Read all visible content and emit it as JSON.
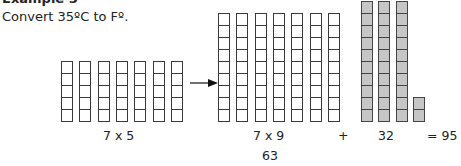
{
  "header": {
    "title": "Example 5",
    "prompt": "Convert 35ºC to Fº."
  },
  "diagram": {
    "groups": [
      {
        "name": "celsius-grid",
        "columns": 7,
        "rows": 5,
        "fill": "#ffffff",
        "label": "7 x 5"
      },
      {
        "name": "scaled-grid",
        "columns": 7,
        "rows": 9,
        "fill": "#ffffff",
        "label": "7 x 9",
        "sublabel": "63"
      },
      {
        "name": "offset-grid",
        "columns": [
          10,
          10,
          10,
          2
        ],
        "fill": "#c6c6c6",
        "label": "32"
      }
    ],
    "arrow": "right-arrow",
    "plus_sign": "+",
    "result": "= 95"
  },
  "colors": {
    "border": "#3a3a3a",
    "gray_fill": "#c6c6c6",
    "text": "#222222"
  }
}
